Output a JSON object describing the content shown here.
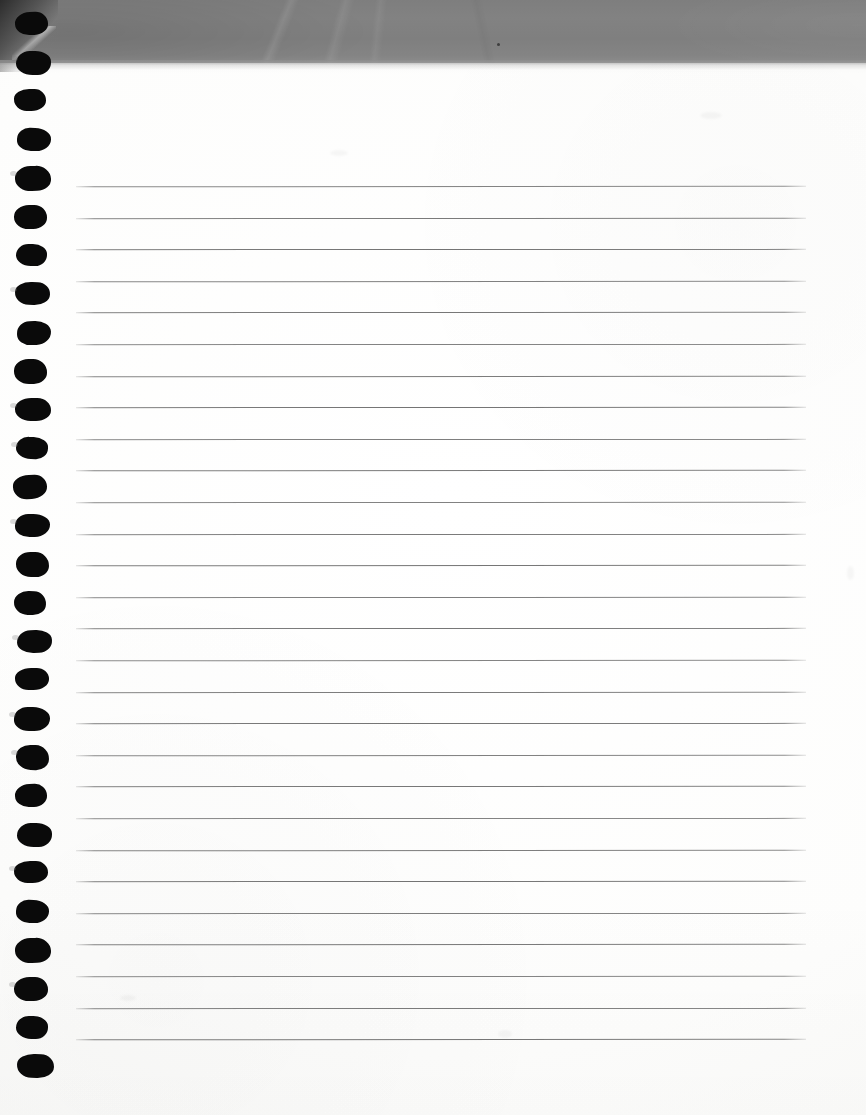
{
  "document": {
    "kind": "scanned-page",
    "title": "Blank ruled notepad page",
    "description": "Scan of a blank spiral-bound ruled notepad sheet with a grey scanner backing band across the top",
    "width_px": 866,
    "height_px": 1115,
    "text_content": "",
    "handwriting_present": "no",
    "printed_text_present": "no"
  },
  "colors": {
    "paper": "#ffffff",
    "paper_shade": "#f8f8f6",
    "band_gray": "#808080",
    "band_gray_dark": "#7e7e7e",
    "band_gray_light": "#8c8c8c",
    "corner_shadow": "#262626",
    "hole_black": "#0a0a0a",
    "rule_gray": "#686868"
  },
  "top_band": {
    "name": "scanner-backing-band",
    "top_px": 0,
    "height_px": 63,
    "fade_height_px": 14,
    "speck": {
      "x": 497,
      "y": 43
    }
  },
  "spiral": {
    "name": "spiral-binding-holes",
    "hole_count": 28,
    "first_hole_y": 12,
    "spacing_px": 38.6,
    "hole_left_px": 15,
    "hole_width_px": 33,
    "hole_height_px": 23
  },
  "ruling": {
    "name": "ruled-lines",
    "line_count": 28,
    "first_line_y": 186,
    "spacing_px": 31.6,
    "left_px": 76,
    "right_px": 806,
    "thickness_px": 1
  },
  "margins": {
    "left_margin_px": 76,
    "right_margin_px": 60,
    "top_margin_px": 186,
    "bottom_margin_px": 56
  },
  "artifacts": [
    {
      "name": "paper-smudge-upper-right",
      "x": 700,
      "y": 112,
      "w": 22,
      "h": 7
    },
    {
      "name": "paper-smudge-mid-right",
      "x": 847,
      "y": 566,
      "w": 7,
      "h": 14
    },
    {
      "name": "paper-smudge-center",
      "x": 498,
      "y": 1030,
      "w": 14,
      "h": 8
    },
    {
      "name": "paper-smudge-left-low",
      "x": 120,
      "y": 995,
      "w": 16,
      "h": 6
    },
    {
      "name": "paper-smudge-upper-left",
      "x": 330,
      "y": 150,
      "w": 18,
      "h": 6
    }
  ]
}
